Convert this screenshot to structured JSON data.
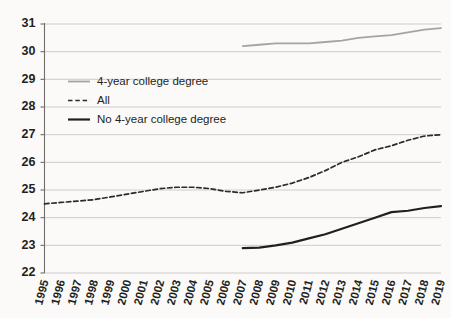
{
  "chart_data": {
    "type": "line",
    "title": "",
    "subtitle": "",
    "xlabel": "",
    "ylabel": "",
    "ylim": [
      22,
      31
    ],
    "yticks": [
      22,
      23,
      24,
      25,
      26,
      27,
      28,
      29,
      30,
      31
    ],
    "grid": true,
    "legend_position": "upper-left-inside",
    "x": [
      1995,
      1996,
      1997,
      1998,
      1999,
      2000,
      2001,
      2002,
      2003,
      2004,
      2005,
      2006,
      2007,
      2008,
      2009,
      2010,
      2011,
      2012,
      2013,
      2014,
      2015,
      2016,
      2017,
      2018,
      2019
    ],
    "categories": [
      "1995",
      "1996",
      "1997",
      "1998",
      "1999",
      "2000",
      "2001",
      "2002",
      "2003",
      "2004",
      "2005",
      "2006",
      "2007",
      "2008",
      "2009",
      "2010",
      "2011",
      "2012",
      "2013",
      "2014",
      "2015",
      "2016",
      "2017",
      "2018",
      "2019"
    ],
    "series": [
      {
        "name": "4-year college degree",
        "style": "solid",
        "color": "#a6a4a1",
        "width": 1.8,
        "x": [
          2007,
          2008,
          2009,
          2010,
          2011,
          2012,
          2013,
          2014,
          2015,
          2016,
          2017,
          2018,
          2019
        ],
        "values": [
          30.2,
          30.25,
          30.3,
          30.3,
          30.3,
          30.35,
          30.4,
          30.5,
          30.55,
          30.6,
          30.7,
          30.8,
          30.85
        ]
      },
      {
        "name": "All",
        "style": "dashed",
        "color": "#2b2b2b",
        "width": 1.7,
        "x": [
          1995,
          1996,
          1997,
          1998,
          1999,
          2000,
          2001,
          2002,
          2003,
          2004,
          2005,
          2006,
          2007,
          2008,
          2009,
          2010,
          2011,
          2012,
          2013,
          2014,
          2015,
          2016,
          2017,
          2018,
          2019
        ],
        "values": [
          24.5,
          24.55,
          24.6,
          24.65,
          24.75,
          24.85,
          24.95,
          25.05,
          25.1,
          25.1,
          25.05,
          24.95,
          24.9,
          25.0,
          25.1,
          25.25,
          25.45,
          25.7,
          26.0,
          26.2,
          26.45,
          26.6,
          26.8,
          26.95,
          27.0
        ]
      },
      {
        "name": "No 4-year college degree",
        "style": "solid",
        "color": "#231f20",
        "width": 2.2,
        "x": [
          2007,
          2008,
          2009,
          2010,
          2011,
          2012,
          2013,
          2014,
          2015,
          2016,
          2017,
          2018,
          2019
        ],
        "values": [
          22.9,
          22.92,
          23.0,
          23.1,
          23.25,
          23.4,
          23.6,
          23.8,
          24.0,
          24.2,
          24.25,
          24.35,
          24.42
        ]
      }
    ],
    "legend": [
      {
        "label": "4-year college degree",
        "style": "solid",
        "color": "#a6a4a1",
        "width": 1.8
      },
      {
        "label": "All",
        "style": "dashed",
        "color": "#2b2b2b",
        "width": 1.7
      },
      {
        "label": "No 4-year college degree",
        "style": "solid",
        "color": "#231f20",
        "width": 2.2
      }
    ]
  }
}
